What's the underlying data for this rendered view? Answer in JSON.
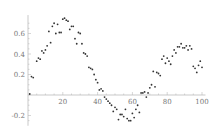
{
  "chart_data": {
    "type": "scatter",
    "title": "",
    "xlabel": "",
    "ylabel": "",
    "xlim": [
      0,
      102
    ],
    "ylim": [
      -0.3,
      0.78
    ],
    "grid": false,
    "legend": null,
    "x_ticks": [
      20,
      40,
      60,
      80,
      100
    ],
    "x_tick_labels": [
      "20",
      "40",
      "60",
      "80",
      "100"
    ],
    "y_ticks": [
      -0.2,
      0.2,
      0.4,
      0.6
    ],
    "y_tick_labels": [
      "-0.2",
      "0.2",
      "0.4",
      "0.6"
    ],
    "series": [
      {
        "name": "data",
        "color": "#333333",
        "x": [
          1,
          2,
          3,
          5,
          6,
          7,
          8,
          9,
          10,
          11,
          12,
          13,
          14,
          15,
          16,
          17,
          18,
          19,
          20,
          21,
          22,
          23,
          24,
          25,
          26,
          27,
          28,
          29,
          30,
          31,
          32,
          33,
          34,
          35,
          36,
          37,
          38,
          39,
          40,
          41,
          42,
          43,
          44,
          45,
          46,
          47,
          48,
          49,
          50,
          51,
          52,
          53,
          54,
          55,
          56,
          57,
          58,
          59,
          60,
          61,
          62,
          63,
          64,
          65,
          66,
          67,
          68,
          69,
          70,
          71,
          72,
          73,
          74,
          75,
          76,
          77,
          78,
          79,
          80,
          81,
          82,
          83,
          84,
          85,
          86,
          87,
          88,
          89,
          90,
          91,
          92,
          93,
          94,
          95,
          96,
          97,
          98,
          99,
          100
        ],
        "y": [
          0.01,
          0.18,
          0.17,
          0.33,
          0.36,
          0.35,
          0.43,
          0.41,
          0.44,
          0.48,
          0.62,
          0.51,
          0.67,
          0.7,
          0.6,
          0.69,
          0.61,
          0.61,
          0.74,
          0.75,
          0.73,
          0.72,
          0.64,
          0.67,
          0.67,
          0.55,
          0.5,
          0.61,
          0.6,
          0.5,
          0.41,
          0.4,
          0.38,
          0.27,
          0.26,
          0.25,
          0.2,
          0.15,
          0.12,
          0.05,
          0.06,
          0.04,
          -0.02,
          -0.04,
          -0.06,
          -0.08,
          -0.1,
          -0.16,
          -0.12,
          -0.14,
          -0.24,
          -0.19,
          -0.19,
          -0.21,
          -0.14,
          -0.23,
          -0.25,
          -0.25,
          -0.18,
          -0.22,
          -0.14,
          -0.1,
          -0.17,
          0.02,
          0.02,
          0.03,
          -0.02,
          0.02,
          0.07,
          0.1,
          0.23,
          0.08,
          0.22,
          0.21,
          0.19,
          0.35,
          0.38,
          0.31,
          0.36,
          0.33,
          0.3,
          0.38,
          0.44,
          0.41,
          0.47,
          0.47,
          0.5,
          0.46,
          0.46,
          0.48,
          0.44,
          0.48,
          0.45,
          0.28,
          0.26,
          0.22,
          0.29,
          0.33,
          0.27
        ]
      }
    ],
    "axes_origin": [
      0,
      0
    ]
  }
}
